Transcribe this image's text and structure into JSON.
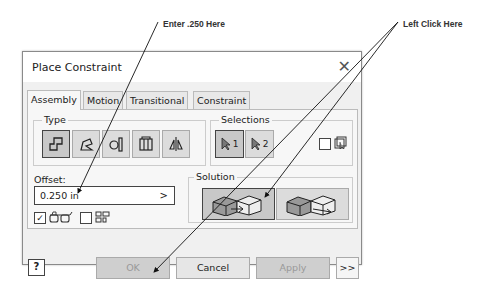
{
  "callouts": {
    "enter": "Enter .250 Here",
    "click": "Left Click Here"
  },
  "dialog": {
    "title": "Place Constraint",
    "close_icon": "close-icon",
    "tabs": [
      {
        "label": "Assembly",
        "active": true
      },
      {
        "label": "Motion",
        "active": false
      },
      {
        "label": "Transitional",
        "active": false
      },
      {
        "label": "Constraint Set",
        "active": false
      }
    ],
    "type": {
      "label": "Type",
      "buttons": [
        {
          "name": "mate-icon",
          "selected": true
        },
        {
          "name": "angle-icon",
          "selected": false
        },
        {
          "name": "tangent-icon",
          "selected": false
        },
        {
          "name": "insert-icon",
          "selected": false
        },
        {
          "name": "symmetry-icon",
          "selected": false
        }
      ]
    },
    "selections": {
      "label": "Selections",
      "sel1": "1",
      "sel2": "2",
      "checkbox_checked": false
    },
    "offset": {
      "label": "Offset:",
      "value": "0.250 in",
      "arrow": ">"
    },
    "show_preview_checked": true,
    "predict_offset_checked": false,
    "solution": {
      "label": "Solution",
      "options": [
        {
          "name": "mate-solution",
          "selected": true
        },
        {
          "name": "flush-solution",
          "selected": false
        }
      ]
    },
    "buttons": {
      "ok": "OK",
      "cancel": "Cancel",
      "apply": "Apply",
      "more": ">>",
      "help": "?"
    },
    "checkmark": "✓"
  }
}
